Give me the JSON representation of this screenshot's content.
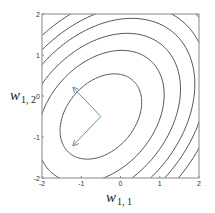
{
  "chart_data": {
    "type": "contour",
    "title": "",
    "xlabel": "w_{1,1}",
    "ylabel": "w_{1,2}",
    "xlabel_main": "w",
    "xlabel_sub": "1, 1",
    "ylabel_main": "w",
    "ylabel_sub": "1, 2",
    "xlim": [
      -2,
      2
    ],
    "ylim": [
      -2,
      2
    ],
    "x_ticks": [
      "-2",
      "-1",
      "0",
      "1",
      "2"
    ],
    "y_ticks": [
      "-2",
      "-1",
      "0",
      "1",
      "2"
    ],
    "grid": false,
    "legend": null,
    "center": [
      -0.5,
      -0.5
    ],
    "ellipse_orientation_deg": 45,
    "contour_levels": [
      {
        "semi_major": 1.2,
        "semi_minor": 0.85
      },
      {
        "semi_major": 1.86,
        "semi_minor": 1.32
      },
      {
        "semi_major": 2.34,
        "semi_minor": 1.66
      },
      {
        "semi_major": 2.76,
        "semi_minor": 1.96
      },
      {
        "semi_major": 3.12,
        "semi_minor": 2.21
      },
      {
        "semi_major": 3.48,
        "semi_minor": 2.47
      }
    ],
    "arrows": [
      {
        "from": [
          -0.5,
          -0.5
        ],
        "to": [
          -1.2,
          0.2
        ],
        "label": "eigenvector (minor axis)"
      },
      {
        "from": [
          -0.5,
          -0.5
        ],
        "to": [
          -1.2,
          -1.2
        ],
        "label": "eigenvector (major axis)"
      }
    ],
    "colors": {
      "contour": "#555555",
      "arrow": "#6f8fb0",
      "frame": "#888888"
    }
  }
}
